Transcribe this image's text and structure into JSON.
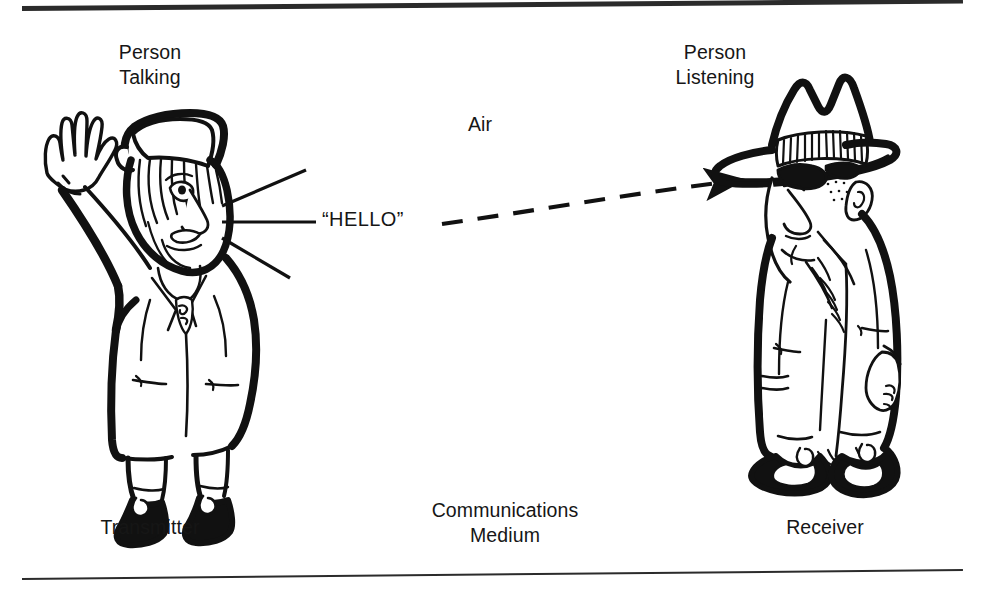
{
  "figure": {
    "background_color": "#ffffff",
    "ink_color": "#161616"
  },
  "rules": {
    "top": {
      "name": "top-rule",
      "thickness_px": 5
    },
    "bottom": {
      "name": "bottom-rule",
      "thickness_px": 2
    }
  },
  "labels": {
    "person_talking": "Person\nTalking",
    "person_listening": "Person\nListening",
    "air": "Air",
    "transmitter": "Transmitter",
    "communications_medium": "Communications\nMedium",
    "receiver": "Receiver",
    "hello": "“HELLO”"
  },
  "figures": {
    "left": {
      "role": "Transmitter",
      "caption": "Person Talking",
      "description": "Cartoon person wearing a flat hat, waving right hand, speech lines radiating from mouth"
    },
    "right": {
      "role": "Receiver",
      "caption": "Person Listening",
      "description": "Cartoon person wearing a cowboy hat with striped hatband, large ear, hands at sides"
    }
  },
  "signal": {
    "name": "sound-wave-path",
    "style": "dashed",
    "arrowhead": "right",
    "from": "Person Talking mouth",
    "to": "Person Listening ear",
    "medium": "Air"
  }
}
